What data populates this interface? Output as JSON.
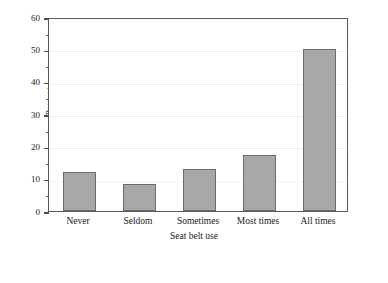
{
  "chart_data": {
    "type": "bar",
    "title": "",
    "categories": [
      "Never",
      "Seldom",
      "Sometimes",
      "Most times",
      "All times"
    ],
    "values": [
      12,
      8.3,
      13,
      17.3,
      50
    ],
    "xlabel": "Seat belt use",
    "ylabel": "Percent",
    "ylim": [
      0,
      60
    ],
    "yticks": [
      0,
      10,
      20,
      30,
      40,
      50,
      60
    ],
    "ytick_labels": [
      "0",
      "10",
      "20",
      "30",
      "40",
      "50",
      "60"
    ],
    "yminor_ticks": [
      5,
      15,
      25,
      35,
      45,
      55
    ],
    "grid": true,
    "grid_axis": "y",
    "legend": false,
    "bar_color": "#a8a8a8",
    "bar_edge_color": "#6b6b6b",
    "frame_color": "#5a5a5a",
    "grid_color": "#f1f1f1",
    "background": "#ffffff"
  }
}
